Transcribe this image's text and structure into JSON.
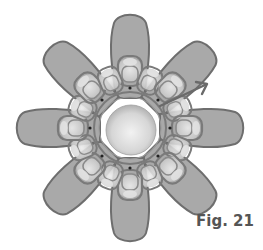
{
  "figure": {
    "caption": "Fig. 21",
    "center": [
      130,
      128
    ],
    "petal_count": 8,
    "colors": {
      "petal_fill": "#a9a9a9",
      "petal_stroke": "#6e6e6e",
      "loop_stroke": "#7a7a7a",
      "loop_highlight": "#dcdcdc",
      "sphere_light": "#eeeeee",
      "sphere_dark": "#b5b5b5",
      "caption": "#555555"
    },
    "arrow_icon": "arrow-upper-right"
  }
}
